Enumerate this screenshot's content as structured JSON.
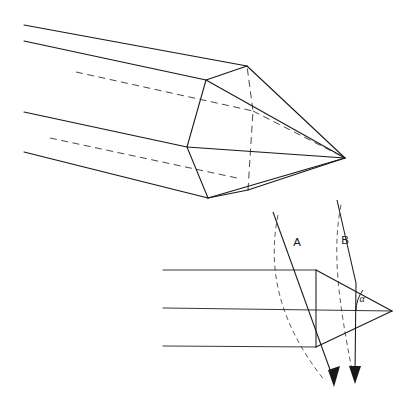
{
  "figure": {
    "background_color": "#ffffff",
    "line_color": "#16181a",
    "hidden_line_color": "#3a3d40",
    "width": 409,
    "height": 401
  },
  "upper_view": {
    "name": "isometric-pencil-view",
    "description": "Three-quarter perspective of a hexagonal pencil shaft sharpened to a conical point",
    "shaft_edges": [
      {
        "name": "top-edge",
        "points": "24,25 247,66"
      },
      {
        "name": "upper-front-edge",
        "points": "24,41 206,80"
      },
      {
        "name": "lower-front-edge",
        "points": "24,112 187,147"
      },
      {
        "name": "bottom-edge",
        "points": "24,152 208,198"
      }
    ],
    "hidden_shaft_edges": [
      {
        "name": "hidden-upper-edge",
        "points": "76,72 253,111"
      },
      {
        "name": "hidden-lower-edge",
        "points": "50,138 237,178"
      }
    ],
    "hexagon_vertices": [
      {
        "name": "vertex-top",
        "x": 247,
        "y": 66
      },
      {
        "name": "vertex-upper-left",
        "x": 206,
        "y": 80
      },
      {
        "name": "vertex-left",
        "x": 187,
        "y": 147
      },
      {
        "name": "vertex-bottom-left",
        "x": 208,
        "y": 198
      },
      {
        "name": "vertex-bottom-right",
        "x": 248,
        "y": 190
      },
      {
        "name": "vertex-right",
        "x": 253,
        "y": 111
      }
    ],
    "tip": {
      "name": "pencil-tip",
      "x": 345,
      "y": 158
    },
    "facet_count": 6
  },
  "lower_view": {
    "name": "axial-profile-view",
    "description": "Side elevation of the pencil point with two incident rays and the half-angle alpha",
    "body_lines": [
      {
        "name": "body-top-line",
        "points": "163,270 316,270"
      },
      {
        "name": "body-axis-line",
        "points": "163,308 392,311"
      },
      {
        "name": "body-bottom-line",
        "points": "163,346 316,347"
      }
    ],
    "shoulder_line": {
      "name": "shoulder-line",
      "points": "316,270 316,347"
    },
    "cone_upper": {
      "name": "cone-upper-surface",
      "points": "316,270 392,311"
    },
    "cone_lower": {
      "name": "cone-lower-surface",
      "points": "316,347 392,311"
    },
    "tip": {
      "name": "profile-tip",
      "x": 392,
      "y": 311
    },
    "rays": [
      {
        "name": "ray-a",
        "label": "A",
        "label_x": 297,
        "label_y": 243,
        "path": "273,212 333,380",
        "arrow_tip": {
          "x": 334,
          "y": 387
        },
        "arrow_angle_deg": 70.4,
        "type": "straight"
      },
      {
        "name": "ray-b",
        "label": "B",
        "label_x": 345,
        "label_y": 241,
        "incident_path": "337,200 356,283",
        "refracted_path": "356,283 355,377",
        "arrow_tip": {
          "x": 355,
          "y": 384
        },
        "arrow_angle_deg": 90,
        "type": "refracted"
      }
    ],
    "wavefronts": [
      {
        "name": "wavefront-a",
        "path": "M 278,215 C 268,265 276,320 325,381"
      },
      {
        "name": "wavefront-b",
        "path": "M 341,205 C 332,250 338,300 353,375"
      }
    ],
    "angle": {
      "name": "half-angle-alpha",
      "label": "α",
      "label_x": 362,
      "label_y": 300,
      "vertex_x": 392,
      "vertex_y": 311,
      "arc_radius": 36,
      "arc_path": "M 356,311 A 36 36 0 0 1 363,290"
    }
  }
}
